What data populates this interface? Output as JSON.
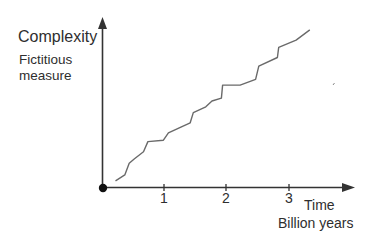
{
  "chart_data": {
    "type": "line",
    "title": "",
    "ylabel": "Complexity",
    "ylabel_sub": "Fictitious measure",
    "xlabel": "Time",
    "xlabel_sub": "Billion years",
    "x_ticks": [
      "1",
      "2",
      "3"
    ],
    "xlim": [
      0,
      4
    ],
    "grid": false,
    "legend": null,
    "series": [
      {
        "name": "Complexity (stepwise increase)",
        "note": "Staircase-like rising curve; y is fictitious/unitless",
        "x": [
          0.2,
          0.35,
          0.42,
          0.5,
          0.65,
          0.72,
          0.97,
          1.05,
          1.25,
          1.4,
          1.45,
          1.65,
          1.75,
          1.9,
          1.92,
          2.2,
          2.45,
          2.5,
          2.8,
          2.82,
          3.1,
          3.32
        ],
        "y": [
          0.05,
          0.09,
          0.17,
          0.2,
          0.25,
          0.32,
          0.33,
          0.38,
          0.42,
          0.45,
          0.52,
          0.56,
          0.6,
          0.62,
          0.71,
          0.71,
          0.75,
          0.84,
          0.9,
          0.97,
          1.02,
          1.09
        ]
      }
    ]
  },
  "labels": {
    "y_main": "Complexity",
    "y_sub_line1": "Fictitious",
    "y_sub_line2": "measure",
    "x_main": "Time",
    "x_sub": "Billion years",
    "tick_1": "1",
    "tick_2": "2",
    "tick_3": "3"
  },
  "colors": {
    "axis": "#333333",
    "curve": "#6a6a6a",
    "text": "#2e2e2e"
  }
}
